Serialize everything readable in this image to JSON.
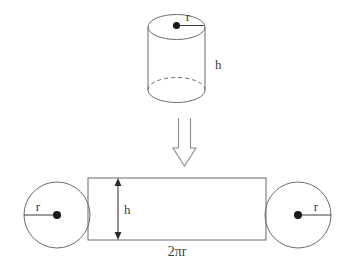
{
  "figure": {
    "background_color": "#ffffff",
    "line_color": "#6b6b6b",
    "label_color": "#3c3c3c"
  },
  "cylinder": {
    "name": "cylinder-solid",
    "radius_label": "r",
    "height_label": "h",
    "center_dot": true,
    "hidden_edge_style": "dashed"
  },
  "transform_arrow": {
    "name": "downward-unfold-arrow",
    "direction": "down",
    "style": "hollow-outline"
  },
  "net": {
    "left_circle": {
      "name": "left-base-circle",
      "radius_label": "r",
      "radius_direction": "left"
    },
    "right_circle": {
      "name": "right-base-circle",
      "radius_label": "r",
      "radius_direction": "right"
    },
    "rectangle": {
      "name": "lateral-surface-rectangle",
      "height_label": "h",
      "width_label": "2πr"
    }
  }
}
